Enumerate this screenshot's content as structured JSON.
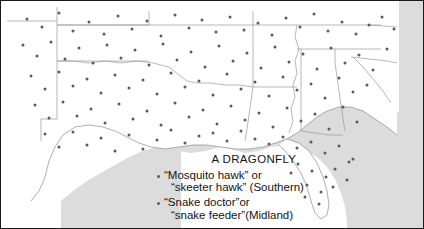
{
  "figure": {
    "kind": "dialect dot-density map",
    "region": "Southern and Midland United States",
    "frame_color": "#1a1a1a",
    "land_color": "#ffffff",
    "water_color": "#dcdcdc",
    "boundary_color": "#9a9a9a",
    "dot_color": "#5b5b5b"
  },
  "legend": {
    "title": "A DRAGONFLY",
    "entries": [
      {
        "bullet": "dot-marker",
        "line1": "“Mosquito hawk” or",
        "line2": "“skeeter hawk” (Southern)"
      },
      {
        "bullet": "dot-marker",
        "line1": "“Snake doctor”or",
        "line2": "“snake feeder”(Midland)"
      }
    ]
  },
  "chart_data": {
    "type": "scatter",
    "title": "A DRAGONFLY",
    "xlabel": "",
    "ylabel": "",
    "legend_position": "bottom-center",
    "grid": false,
    "series": [
      {
        "name": "“Mosquito hawk” or “skeeter hawk” (Southern)",
        "marker": "dot",
        "color": "#5b5b5b"
      },
      {
        "name": "“Snake doctor”or “snake feeder”(Midland)",
        "marker": "dot",
        "color": "#5b5b5b"
      }
    ],
    "points": [
      [
        26,
        18
      ],
      [
        41,
        26
      ],
      [
        58,
        12
      ],
      [
        72,
        30
      ],
      [
        88,
        21
      ],
      [
        103,
        33
      ],
      [
        117,
        15
      ],
      [
        131,
        28
      ],
      [
        146,
        20
      ],
      [
        160,
        35
      ],
      [
        174,
        14
      ],
      [
        188,
        27
      ],
      [
        201,
        19
      ],
      [
        215,
        31
      ],
      [
        229,
        16
      ],
      [
        243,
        29
      ],
      [
        257,
        22
      ],
      [
        271,
        34
      ],
      [
        285,
        17
      ],
      [
        299,
        26
      ],
      [
        313,
        13
      ],
      [
        327,
        30
      ],
      [
        341,
        21
      ],
      [
        355,
        33
      ],
      [
        368,
        24
      ],
      [
        381,
        16
      ],
      [
        393,
        28
      ],
      [
        22,
        44
      ],
      [
        36,
        55
      ],
      [
        50,
        41
      ],
      [
        64,
        58
      ],
      [
        78,
        47
      ],
      [
        92,
        62
      ],
      [
        106,
        44
      ],
      [
        120,
        57
      ],
      [
        134,
        49
      ],
      [
        148,
        64
      ],
      [
        162,
        43
      ],
      [
        176,
        59
      ],
      [
        190,
        51
      ],
      [
        204,
        66
      ],
      [
        218,
        45
      ],
      [
        232,
        60
      ],
      [
        246,
        52
      ],
      [
        260,
        67
      ],
      [
        274,
        46
      ],
      [
        288,
        61
      ],
      [
        302,
        53
      ],
      [
        316,
        68
      ],
      [
        330,
        47
      ],
      [
        344,
        62
      ],
      [
        358,
        54
      ],
      [
        372,
        69
      ],
      [
        386,
        48
      ],
      [
        30,
        75
      ],
      [
        44,
        88
      ],
      [
        58,
        71
      ],
      [
        72,
        85
      ],
      [
        86,
        78
      ],
      [
        100,
        92
      ],
      [
        114,
        74
      ],
      [
        128,
        87
      ],
      [
        142,
        79
      ],
      [
        156,
        93
      ],
      [
        170,
        72
      ],
      [
        184,
        86
      ],
      [
        198,
        80
      ],
      [
        212,
        94
      ],
      [
        226,
        73
      ],
      [
        240,
        88
      ],
      [
        254,
        81
      ],
      [
        268,
        95
      ],
      [
        282,
        76
      ],
      [
        296,
        89
      ],
      [
        310,
        83
      ],
      [
        324,
        97
      ],
      [
        338,
        77
      ],
      [
        352,
        91
      ],
      [
        366,
        84
      ],
      [
        34,
        104
      ],
      [
        48,
        117
      ],
      [
        62,
        101
      ],
      [
        76,
        115
      ],
      [
        90,
        108
      ],
      [
        104,
        122
      ],
      [
        118,
        103
      ],
      [
        132,
        118
      ],
      [
        146,
        110
      ],
      [
        160,
        124
      ],
      [
        174,
        102
      ],
      [
        188,
        116
      ],
      [
        202,
        109
      ],
      [
        216,
        123
      ],
      [
        230,
        105
      ],
      [
        244,
        119
      ],
      [
        258,
        112
      ],
      [
        272,
        126
      ],
      [
        286,
        107
      ],
      [
        300,
        120
      ],
      [
        314,
        113
      ],
      [
        328,
        128
      ],
      [
        342,
        106
      ],
      [
        356,
        121
      ],
      [
        44,
        133
      ],
      [
        58,
        146
      ],
      [
        72,
        131
      ],
      [
        86,
        144
      ],
      [
        100,
        137
      ],
      [
        114,
        150
      ],
      [
        128,
        134
      ],
      [
        142,
        148
      ],
      [
        156,
        139
      ],
      [
        170,
        129
      ],
      [
        184,
        142
      ],
      [
        198,
        135
      ],
      [
        212,
        132
      ],
      [
        226,
        140
      ],
      [
        240,
        130
      ],
      [
        254,
        138
      ],
      [
        268,
        143
      ],
      [
        282,
        136
      ],
      [
        296,
        147
      ],
      [
        310,
        141
      ],
      [
        324,
        152
      ],
      [
        338,
        145
      ],
      [
        352,
        158
      ],
      [
        297,
        163
      ],
      [
        311,
        170
      ],
      [
        325,
        176
      ],
      [
        306,
        184
      ],
      [
        320,
        191
      ],
      [
        334,
        168
      ],
      [
        348,
        161
      ],
      [
        290,
        172
      ],
      [
        304,
        196
      ],
      [
        318,
        203
      ],
      [
        332,
        186
      ],
      [
        346,
        179
      ]
    ]
  }
}
